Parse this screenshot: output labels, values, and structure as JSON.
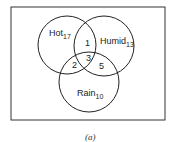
{
  "diagram": {
    "type": "venn",
    "caption": "(a)",
    "sets": [
      {
        "name": "Hot",
        "count": "17"
      },
      {
        "name": "Humid",
        "count": "13"
      },
      {
        "name": "Rain",
        "count": "10"
      }
    ],
    "intersections": {
      "hot_humid": "1",
      "hot_rain": "2",
      "hot_humid_rain": "3",
      "humid_rain": "5"
    },
    "colors": {
      "line": "#222222",
      "background": "#ffffff"
    }
  }
}
